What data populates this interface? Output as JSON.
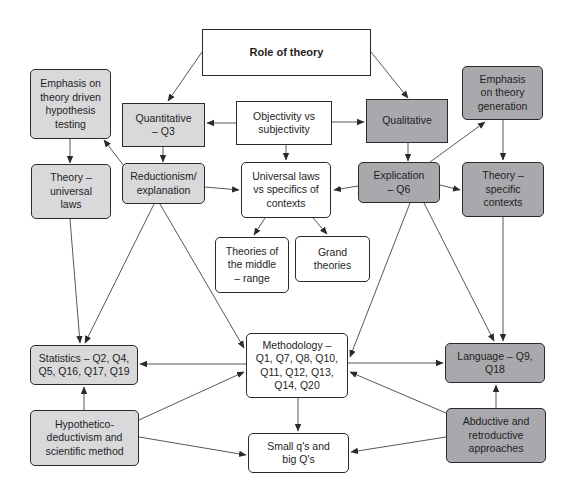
{
  "diagram": {
    "type": "concept map",
    "colors": {
      "white_fill": "#ffffff",
      "quantitative_fill": "#d9d9dc",
      "qualitative_fill": "#a9a9ad",
      "stroke": "#2a2a2a"
    },
    "nodes": {
      "role_of_theory": {
        "label": "Role of theory"
      },
      "emphasis_hypothesis": {
        "label": "Emphasis on\ntheory driven\nhypothesis\ntesting"
      },
      "quantitative": {
        "label": "Quantitative\n– Q3"
      },
      "objectivity": {
        "label": "Objectivity vs\nsubjectivity"
      },
      "qualitative": {
        "label": "Qualitative"
      },
      "emphasis_generation": {
        "label": "Emphasis\non theory\ngeneration"
      },
      "theory_universal": {
        "label": "Theory –\nuniversal\nlaws"
      },
      "reductionism": {
        "label": "Reductionism/\nexplanation"
      },
      "universal_vs_specifics": {
        "label": "Universal laws\nvs specifics of\ncontexts"
      },
      "explication": {
        "label": "Explication\n– Q6"
      },
      "theory_specific": {
        "label": "Theory –\nspecific\ncontexts"
      },
      "middle_range": {
        "label": "Theories of\nthe middle\n– range"
      },
      "grand_theories": {
        "label": "Grand\ntheories"
      },
      "statistics": {
        "label": "Statistics – Q2, Q4,\nQ5, Q16, Q17, Q19"
      },
      "methodology": {
        "label": "Methodology –\nQ1, Q7, Q8, Q10,\nQ11, Q12, Q13,\nQ14, Q20"
      },
      "language": {
        "label": "Language – Q9,\nQ18"
      },
      "hypothetico": {
        "label": "Hypothetico-\ndeductivism and\nscientific method"
      },
      "small_big_q": {
        "label": "Small q's and\nbig Q's"
      },
      "abductive": {
        "label": "Abductive and\nretroductive\napproaches"
      }
    },
    "edges": [
      [
        "role_of_theory",
        "quantitative"
      ],
      [
        "role_of_theory",
        "qualitative"
      ],
      [
        "objectivity",
        "quantitative"
      ],
      [
        "objectivity",
        "qualitative"
      ],
      [
        "objectivity",
        "universal_vs_specifics"
      ],
      [
        "quantitative",
        "reductionism"
      ],
      [
        "reductionism",
        "emphasis_hypothesis"
      ],
      [
        "emphasis_hypothesis",
        "theory_universal"
      ],
      [
        "reductionism",
        "universal_vs_specifics"
      ],
      [
        "qualitative",
        "explication"
      ],
      [
        "explication",
        "emphasis_generation"
      ],
      [
        "emphasis_generation",
        "theory_specific"
      ],
      [
        "explication",
        "universal_vs_specifics"
      ],
      [
        "explication",
        "theory_specific"
      ],
      [
        "universal_vs_specifics",
        "middle_range"
      ],
      [
        "universal_vs_specifics",
        "grand_theories"
      ],
      [
        "theory_universal",
        "statistics"
      ],
      [
        "reductionism",
        "statistics"
      ],
      [
        "reductionism",
        "methodology"
      ],
      [
        "explication",
        "methodology"
      ],
      [
        "explication",
        "language"
      ],
      [
        "theory_specific",
        "language"
      ],
      [
        "methodology",
        "statistics"
      ],
      [
        "methodology",
        "language"
      ],
      [
        "methodology",
        "small_big_q"
      ],
      [
        "hypothetico",
        "statistics"
      ],
      [
        "hypothetico",
        "methodology"
      ],
      [
        "hypothetico",
        "small_big_q"
      ],
      [
        "abductive",
        "language"
      ],
      [
        "abductive",
        "methodology"
      ],
      [
        "abductive",
        "small_big_q"
      ]
    ]
  }
}
